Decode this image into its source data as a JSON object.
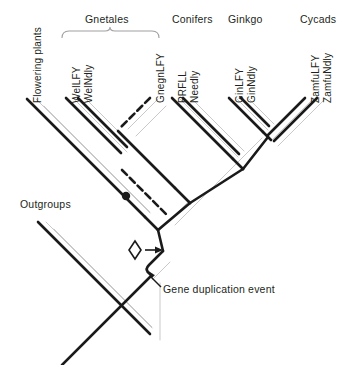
{
  "figure": {
    "type": "phylogenetic-tree"
  },
  "group_labels": [
    {
      "id": "gnetales",
      "text": "Gnetales",
      "x": 110,
      "y": 19,
      "has_bracket": true,
      "bracket_x1": 62,
      "bracket_x2": 159
    },
    {
      "id": "conifers",
      "text": "Conifers",
      "x": 195,
      "y": 19,
      "has_bracket": false
    },
    {
      "id": "ginkgo",
      "text": "Ginkgo",
      "x": 248,
      "y": 19,
      "has_bracket": false
    },
    {
      "id": "cycads",
      "text": "Cycads",
      "x": 318,
      "y": 19,
      "has_bracket": false
    }
  ],
  "tip_labels": [
    {
      "id": "flowering-plants",
      "text": "Flowering plants",
      "x": 32,
      "y": 103
    },
    {
      "id": "wellfy",
      "text": "WelLFY",
      "x": 71,
      "y": 103
    },
    {
      "id": "welndly",
      "text": "WelNdly",
      "x": 83,
      "y": 103
    },
    {
      "id": "gnegnlfy",
      "text": "GnegnLFY",
      "x": 155,
      "y": 103
    },
    {
      "id": "prfll",
      "text": "PRFLL",
      "x": 177,
      "y": 103
    },
    {
      "id": "needly",
      "text": "Needly",
      "x": 189,
      "y": 103
    },
    {
      "id": "ginlfy",
      "text": "GinLFY",
      "x": 234,
      "y": 103
    },
    {
      "id": "ginndly",
      "text": "GinNdly",
      "x": 246,
      "y": 103
    },
    {
      "id": "zamfulfy",
      "text": "ZamfuLFY",
      "x": 310,
      "y": 103
    },
    {
      "id": "zamfundly",
      "text": "ZamfuNdly",
      "x": 322,
      "y": 103
    }
  ],
  "annotations": [
    {
      "id": "outgroups",
      "text": "Outgroups",
      "x": 20,
      "y": 198
    },
    {
      "id": "gene-duplication",
      "text": "Gene duplication event",
      "x": 163,
      "y": 289
    }
  ],
  "markers": {
    "node_dot": {
      "name": "black-node-dot",
      "x": 126,
      "y": 196,
      "r": 4.2
    },
    "diamond": {
      "name": "diamond-marker",
      "cx": 135,
      "cy": 250,
      "rx": 6,
      "ry": 9
    },
    "diamond_arrow": {
      "name": "diamond-arrow",
      "x1": 145,
      "y1": 250,
      "x2": 160,
      "y2": 250
    },
    "duplication_arrow": {
      "name": "gene-duplication-arrow",
      "x1": 162,
      "y1": 288,
      "x2": 148,
      "y2": 274
    }
  },
  "colors": {
    "branch": "#1a1a1a",
    "shadow": "#c9c9c9",
    "text": "#231f20",
    "background": "#ffffff"
  },
  "style_notes": {
    "branch_stroke_width": 2.6,
    "shadow_stroke_width": 1,
    "dashed_branch": "GnegnLFY and its subtending lineage drawn dashed"
  }
}
